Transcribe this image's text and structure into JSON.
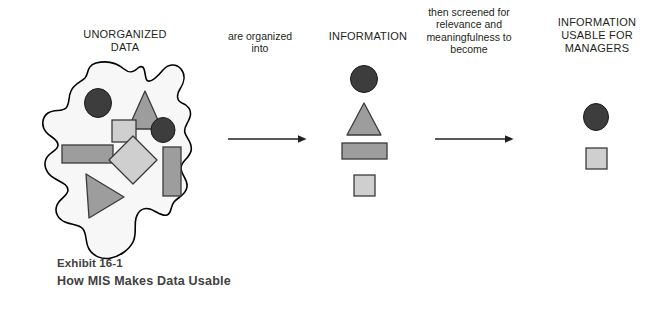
{
  "figure": {
    "caption_exhibit": "Exhibit 16-1",
    "caption_title": "How MIS Makes Data Usable"
  },
  "labels": {
    "unorganized_data": "UNORGANIZED\nDATA",
    "are_organized_into": "are organized\ninto",
    "information": "INFORMATION",
    "then_screened": "then screened for\nrelevance and\nmeaningfulness to\nbecome",
    "information_usable": "INFORMATION\nUSABLE FOR\nMANAGERS"
  },
  "colors": {
    "background": "#ffffff",
    "text": "#231f20",
    "caption_text": "#414042",
    "outline": "#000000",
    "blob_fill": "#f7f7f7",
    "shape_dark": "#3d3d3d",
    "shape_medium": "#9d9d9d",
    "shape_light": "#cfcfcf",
    "arrow": "#231f20"
  },
  "diagram": {
    "type": "process-flow",
    "stages": [
      {
        "name": "unorganized-data",
        "label": "UNORGANIZED DATA",
        "container": "amoeba-blob",
        "shape_count": 9,
        "shapes": [
          {
            "kind": "circle",
            "tone": "dark",
            "cx": 98,
            "cy": 103,
            "rx": 13,
            "ry": 14
          },
          {
            "kind": "triangle",
            "tone": "medium",
            "cx": 145,
            "cy": 110,
            "w": 34,
            "h": 38
          },
          {
            "kind": "square",
            "tone": "light",
            "x": 112,
            "y": 120,
            "w": 24,
            "h": 22
          },
          {
            "kind": "circle",
            "tone": "dark",
            "cx": 163,
            "cy": 130,
            "rx": 12,
            "ry": 12
          },
          {
            "kind": "rectangle",
            "tone": "medium",
            "x": 62,
            "y": 145,
            "w": 50,
            "h": 18
          },
          {
            "kind": "diamond",
            "tone": "light",
            "cx": 133,
            "cy": 160,
            "r": 24
          },
          {
            "kind": "rectangle",
            "tone": "medium",
            "x": 163,
            "y": 147,
            "w": 18,
            "h": 48
          },
          {
            "kind": "triangle",
            "tone": "medium",
            "cx": 104,
            "cy": 196,
            "w": 38,
            "h": 44,
            "direction": "right"
          }
        ]
      },
      {
        "name": "information",
        "label": "INFORMATION",
        "shape_count": 4,
        "shapes": [
          {
            "kind": "circle",
            "tone": "dark",
            "cx": 364,
            "cy": 79,
            "rx": 13,
            "ry": 13
          },
          {
            "kind": "triangle",
            "tone": "medium",
            "cx": 364,
            "cy": 119,
            "w": 32,
            "h": 32
          },
          {
            "kind": "rectangle",
            "tone": "medium",
            "x": 342,
            "y": 143,
            "w": 45,
            "h": 16
          },
          {
            "kind": "square",
            "tone": "light",
            "x": 354,
            "y": 175,
            "w": 21,
            "h": 21
          }
        ]
      },
      {
        "name": "information-usable-for-managers",
        "label": "INFORMATION USABLE FOR MANAGERS",
        "shape_count": 2,
        "shapes": [
          {
            "kind": "circle",
            "tone": "dark",
            "cx": 596,
            "cy": 117,
            "rx": 12,
            "ry": 13
          },
          {
            "kind": "square",
            "tone": "light",
            "x": 586,
            "y": 148,
            "w": 21,
            "h": 21
          }
        ]
      }
    ],
    "arrows": [
      {
        "name": "arrow-data-to-information",
        "x1": 228,
        "y1": 139,
        "x2": 306,
        "y2": 139,
        "label": "are organized into"
      },
      {
        "name": "arrow-information-to-usable",
        "x1": 435,
        "y1": 139,
        "x2": 513,
        "y2": 139,
        "label": "then screened for relevance and meaningfulness to become"
      }
    ]
  }
}
